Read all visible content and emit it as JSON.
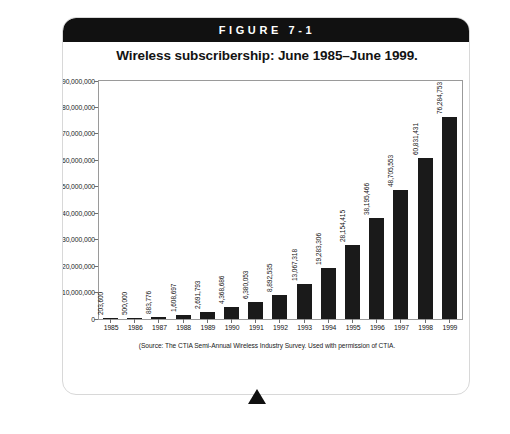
{
  "figure": {
    "label": "FIGURE 7-1",
    "title": "Wireless subscribership: June 1985–June 1999.",
    "source": "(Source: The CTIA Semi-Annual Wireless Industry Survey. Used with permission of CTIA.",
    "pointer_icon": "triangle-pointer-icon"
  },
  "chart_data": {
    "type": "bar",
    "title": "Wireless subscribership: June 1985–June 1999.",
    "xlabel": "",
    "ylabel": "",
    "ylim": [
      0,
      90000000
    ],
    "grid": false,
    "legend": "none",
    "bar_color": "#1a1a1a",
    "categories": [
      "1985",
      "1986",
      "1987",
      "1988",
      "1989",
      "1990",
      "1991",
      "1992",
      "1993",
      "1994",
      "1995",
      "1996",
      "1997",
      "1998",
      "1999"
    ],
    "values": [
      203600,
      500000,
      883776,
      1608697,
      2691793,
      4368686,
      6380053,
      8892535,
      13067318,
      19283306,
      28154415,
      38195466,
      48705553,
      60831431,
      76284753
    ],
    "value_labels": [
      "203,600",
      "500,000",
      "883,776",
      "1,608,697",
      "2,691,793",
      "4,368,686",
      "6,380,053",
      "8,892,535",
      "13,067,318",
      "19,283,306",
      "28,154,415",
      "38,195,466",
      "48,705,553",
      "60,831,431",
      "76,284,753"
    ],
    "y_ticks": [
      0,
      10000000,
      20000000,
      30000000,
      40000000,
      50000000,
      60000000,
      70000000,
      80000000,
      90000000
    ],
    "y_tick_labels": [
      "0",
      "10,000,000",
      "20,000,000",
      "30,000,000",
      "40,000,000",
      "50,000,000",
      "60,000,000",
      "70,000,000",
      "80,000,000",
      "90,000,000"
    ]
  }
}
